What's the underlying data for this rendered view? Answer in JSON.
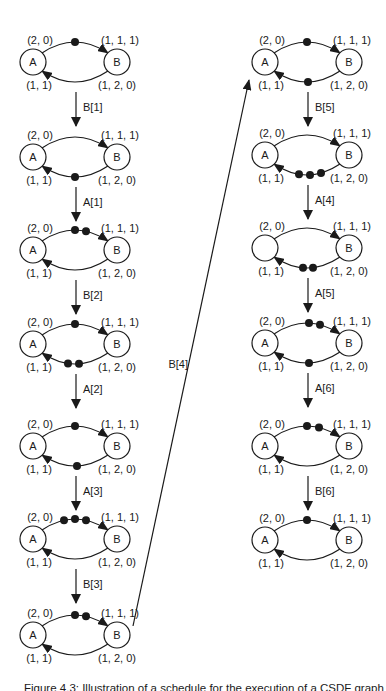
{
  "figure": {
    "caption": "Figure 4.3: Illustration of a schedule for the execution of a CSDF graph",
    "colors": {
      "ink": "#1a1a1a",
      "background": "#ffffff"
    }
  },
  "graph": {
    "node_a": "A",
    "node_b": "B",
    "edge_labels": {
      "top_left": "(2, 0)",
      "top_right": "(1, 1, 1)",
      "bottom_left": "(1, 1)",
      "bottom_right": "(1, 2, 0)"
    }
  },
  "columns": [
    {
      "cx": 75,
      "diagrams": [
        {
          "cy": 62,
          "a": "A",
          "b": "B",
          "top_tokens": [
            0
          ],
          "bottom_tokens": []
        },
        {
          "cy": 157,
          "a": "A",
          "b": "B",
          "top_tokens": [],
          "bottom_tokens": [
            0
          ]
        },
        {
          "cy": 250,
          "a": "A",
          "b": "B",
          "top_tokens": [
            0,
            11
          ],
          "bottom_tokens": []
        },
        {
          "cy": 344,
          "a": "A",
          "b": "B",
          "top_tokens": [
            0
          ],
          "bottom_tokens": [
            -7,
            4
          ]
        },
        {
          "cy": 446,
          "a": "A",
          "b": "B",
          "top_tokens": [
            0
          ],
          "bottom_tokens": [
            2
          ]
        },
        {
          "cy": 539,
          "a": "A",
          "b": "B",
          "top_tokens": [
            -11,
            0,
            11
          ],
          "bottom_tokens": []
        },
        {
          "cy": 635,
          "a": "A",
          "b": "B",
          "top_tokens": [
            0,
            11
          ],
          "bottom_tokens": []
        }
      ],
      "transitions": [
        "B[1]",
        "A[1]",
        "B[2]",
        "A[2]",
        "A[3]",
        "B[3]"
      ]
    },
    {
      "cx": 307,
      "diagrams": [
        {
          "cy": 62,
          "a": "A",
          "b": "B",
          "top_tokens": [
            0
          ],
          "bottom_tokens": [
            1
          ]
        },
        {
          "cy": 155,
          "a": "A",
          "b": "B",
          "top_tokens": [],
          "bottom_tokens": [
            -8,
            3,
            14
          ]
        },
        {
          "cy": 248,
          "a": "",
          "b": "B",
          "top_tokens": [],
          "bottom_tokens": [
            -4,
            6
          ]
        },
        {
          "cy": 343,
          "a": "A",
          "b": "B",
          "top_tokens": [
            2,
            13
          ],
          "bottom_tokens": [
            2
          ]
        },
        {
          "cy": 446,
          "a": "A",
          "b": "B",
          "top_tokens": [
            0,
            12
          ],
          "bottom_tokens": []
        },
        {
          "cy": 540,
          "a": "A",
          "b": "B",
          "top_tokens": [
            0
          ],
          "bottom_tokens": []
        }
      ],
      "transitions": [
        "B[5]",
        "A[4]",
        "A[5]",
        "A[6]",
        "B[6]"
      ]
    }
  ],
  "long_arrow": {
    "label": "B[4]",
    "x1": 133,
    "y1": 626,
    "x2": 249,
    "y2": 80,
    "label_x": 188,
    "label_y": 368
  }
}
